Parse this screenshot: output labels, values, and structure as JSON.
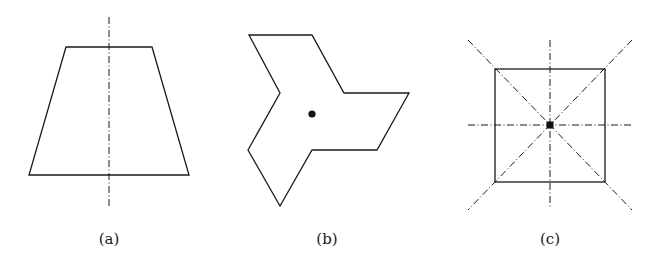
{
  "figure": {
    "panels": [
      {
        "id": "a",
        "label": "(a)",
        "shape": "isosceles-trapezoid",
        "symmetry": "one vertical axis of reflection"
      },
      {
        "id": "b",
        "label": "(b)",
        "shape": "three-armed pinwheel polygon",
        "symmetry": "3-fold rotational symmetry about center point"
      },
      {
        "id": "c",
        "label": "(c)",
        "shape": "square",
        "symmetry": "four axes of reflection and 4-fold rotation about center point"
      }
    ],
    "colors": {
      "stroke": "#1a1a1a",
      "background": "#ffffff"
    }
  }
}
